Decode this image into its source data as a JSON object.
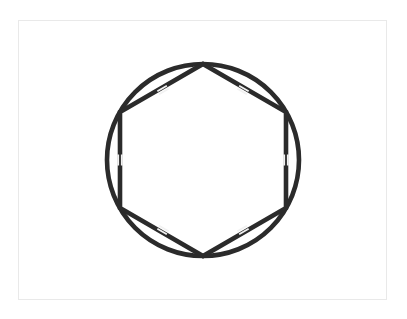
{
  "page": {
    "width": 407,
    "height": 319,
    "background_color": "#ffffff"
  },
  "frame": {
    "name": "figure-border",
    "x": 18,
    "y": 20,
    "width": 369,
    "height": 280,
    "stroke_color": "#e9e9e9",
    "stroke_width": 1.5,
    "fill_color": "#ffffff"
  },
  "diagram": {
    "type": "geometry",
    "stroke_color": "#2b2b2b",
    "tick_color": "#f2f2f2",
    "center": {
      "x": 203,
      "y": 160
    },
    "circle": {
      "name": "circumscribed-circle",
      "cx": 203,
      "cy": 160,
      "r": 96,
      "stroke_width": 4.6,
      "fill": "none"
    },
    "hexagon": {
      "name": "inscribed-hexagon",
      "sides": 6,
      "orientation": "pointy-top",
      "circumradius": 96,
      "stroke_width": 4.6,
      "fill": "none",
      "vertices": [
        {
          "label": "top",
          "angle_deg": 270,
          "x": 203,
          "y": 64
        },
        {
          "label": "upper-right",
          "angle_deg": 330,
          "x": 286,
          "y": 112
        },
        {
          "label": "lower-right",
          "angle_deg": 30,
          "x": 286,
          "y": 208
        },
        {
          "label": "bottom",
          "angle_deg": 90,
          "x": 203,
          "y": 256
        },
        {
          "label": "lower-left",
          "angle_deg": 150,
          "x": 120,
          "y": 208
        },
        {
          "label": "upper-left",
          "angle_deg": 210,
          "x": 120,
          "y": 112
        }
      ],
      "edges": [
        {
          "name": "edge-top-right",
          "from": "top",
          "to": "upper-right"
        },
        {
          "name": "edge-right",
          "from": "upper-right",
          "to": "lower-right"
        },
        {
          "name": "edge-bottom-right",
          "from": "lower-right",
          "to": "bottom"
        },
        {
          "name": "edge-bottom-left",
          "from": "bottom",
          "to": "lower-left"
        },
        {
          "name": "edge-left",
          "from": "lower-left",
          "to": "upper-left"
        },
        {
          "name": "edge-top-left",
          "from": "upper-left",
          "to": "top"
        }
      ]
    },
    "tick_marks": {
      "marks_per_side": 2,
      "meaning": "congruent sides",
      "stroke_width": 1.8,
      "length": 11,
      "spacing": 3.6,
      "items": [
        {
          "name": "tick-top-left-edge",
          "edge": "edge-top-left",
          "x": 163,
          "y": 90,
          "rotation_deg": -30
        },
        {
          "name": "tick-top-right-edge",
          "edge": "edge-top-right",
          "x": 243,
          "y": 90,
          "rotation_deg": 30
        },
        {
          "name": "tick-left-edge",
          "edge": "edge-left",
          "x": 120,
          "y": 160,
          "rotation_deg": 90
        },
        {
          "name": "tick-right-edge",
          "edge": "edge-right",
          "x": 286,
          "y": 160,
          "rotation_deg": 90
        },
        {
          "name": "tick-bottom-left-edge",
          "edge": "edge-bottom-left",
          "x": 163,
          "y": 230,
          "rotation_deg": 30
        },
        {
          "name": "tick-bottom-right-edge",
          "edge": "edge-bottom-right",
          "x": 243,
          "y": 230,
          "rotation_deg": -30
        }
      ]
    }
  }
}
